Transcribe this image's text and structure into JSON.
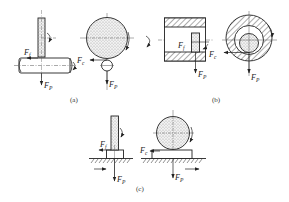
{
  "figure": {
    "panels": [
      {
        "id": "a",
        "caption": "(a)",
        "labels": {
          "friction_force": "F",
          "friction_sub": "f",
          "cutting_force": "F",
          "cutting_sub": "c",
          "feed_force_1": "F",
          "feed_force_1_sub": "P",
          "feed_force_2": "F",
          "feed_force_2_sub": "P"
        }
      },
      {
        "id": "b",
        "caption": "(b)",
        "labels": {
          "friction_force": "F",
          "friction_sub": "f",
          "cutting_force": "F",
          "cutting_sub": "c",
          "feed_force_1": "F",
          "feed_force_1_sub": "P",
          "feed_force_2": "F",
          "feed_force_2_sub": "P"
        }
      },
      {
        "id": "c",
        "caption": "(c)",
        "labels": {
          "friction_force": "F",
          "friction_sub": "f",
          "cutting_force": "F",
          "cutting_sub": "c",
          "feed_force_1": "F",
          "feed_force_1_sub": "P",
          "feed_force_2": "F",
          "feed_force_2_sub": "P"
        }
      }
    ],
    "colors": {
      "line": "#222222",
      "fill_dots": "#cfcfcf",
      "hatch": "#444444",
      "background": "#ffffff"
    }
  }
}
